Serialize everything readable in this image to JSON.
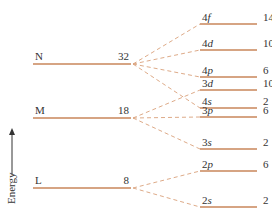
{
  "axis": {
    "label": "Energy"
  },
  "shells": [
    {
      "name": "N",
      "capacity": "32",
      "y": 64
    },
    {
      "name": "M",
      "capacity": "18",
      "y": 118
    },
    {
      "name": "L",
      "capacity": "8",
      "y": 188
    }
  ],
  "subshells": [
    {
      "n": "4",
      "l": "f",
      "capacity": "14",
      "y": 24,
      "shell": 0
    },
    {
      "n": "4",
      "l": "d",
      "capacity": "10",
      "y": 50,
      "shell": 0
    },
    {
      "n": "4",
      "l": "p",
      "capacity": "6",
      "y": 77,
      "shell": 0
    },
    {
      "n": "3",
      "l": "d",
      "capacity": "10",
      "y": 90,
      "shell": 1
    },
    {
      "n": "4",
      "l": "s",
      "capacity": "2",
      "y": 108,
      "shell": 0
    },
    {
      "n": "3",
      "l": "p",
      "capacity": "6",
      "y": 117,
      "shell": 1
    },
    {
      "n": "3",
      "l": "s",
      "capacity": "2",
      "y": 149,
      "shell": 1
    },
    {
      "n": "2",
      "l": "p",
      "capacity": "6",
      "y": 171,
      "shell": 2
    },
    {
      "n": "2",
      "l": "s",
      "capacity": "2",
      "y": 207,
      "shell": 2
    }
  ],
  "colors": {
    "line": "#c8865a",
    "dash": "#d9a07a"
  }
}
